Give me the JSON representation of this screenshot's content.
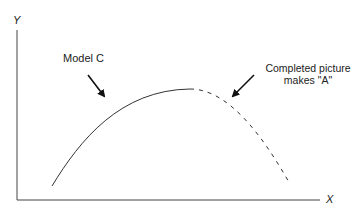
{
  "diagram": {
    "axes": {
      "y_label": "Y",
      "x_label": "X"
    },
    "annotations": {
      "model_c": "Model C",
      "completed_line1": "Completed picture",
      "completed_line2": "makes \"A\""
    },
    "curve": {
      "solid_segment": "Model C (rising portion, solid line)",
      "dashed_segment": "Completed picture (falling portion, dashed line)",
      "color": "#333333"
    }
  }
}
